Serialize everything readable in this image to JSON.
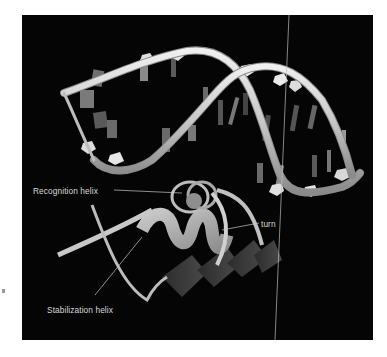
{
  "figure": {
    "labels": {
      "recognition_helix": "Recognition helix",
      "turn": "turn",
      "stabilization_helix": "Stabilization helix"
    },
    "colors": {
      "background": "#050505",
      "backbone": "#d6d6d6",
      "label_text": "#d8d8d8",
      "leader_line": "#c8c8c8",
      "protein_light": "#a8a8a8",
      "protein_dark": "#3a3a3a"
    }
  }
}
